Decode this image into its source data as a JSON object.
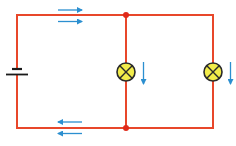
{
  "diagram": {
    "type": "circuit",
    "colors": {
      "background": "#ffffff",
      "wire": "#e8472a",
      "junction": "#e02a1a",
      "bulb_fill": "#f2ec4a",
      "bulb_outline": "#2a2a2a",
      "arrow": "#2b8fd0",
      "battery": "#1a1a1a"
    },
    "components": {
      "battery": {
        "name": "battery",
        "x": 17,
        "y": 72
      },
      "lamps": [
        {
          "name": "lamp-1",
          "x": 126,
          "y": 72,
          "r": 9
        },
        {
          "name": "lamp-2",
          "x": 213,
          "y": 72,
          "r": 9
        }
      ],
      "junctions": [
        {
          "name": "junction-top",
          "x": 126,
          "y": 15
        },
        {
          "name": "junction-bottom",
          "x": 126,
          "y": 128
        }
      ]
    },
    "current_arrows": [
      {
        "name": "arrow-top-1",
        "direction": "right"
      },
      {
        "name": "arrow-top-2",
        "direction": "right"
      },
      {
        "name": "arrow-bottom-1",
        "direction": "left"
      },
      {
        "name": "arrow-bottom-2",
        "direction": "left"
      },
      {
        "name": "arrow-branch-1",
        "direction": "down"
      },
      {
        "name": "arrow-branch-2",
        "direction": "down"
      }
    ]
  }
}
